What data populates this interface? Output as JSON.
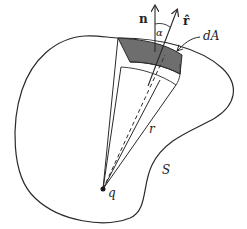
{
  "figure": {
    "labels": {
      "normal": "n",
      "radial_unit": "r̂",
      "angle": "α",
      "area_element": "dA",
      "radius": "r",
      "surface": "S",
      "charge": "q"
    },
    "colors": {
      "stroke": "#2a2a2a",
      "patch_fill": "#6e6e6e",
      "background": "#ffffff"
    }
  }
}
